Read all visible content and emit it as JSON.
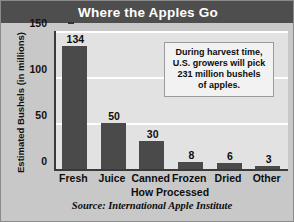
{
  "chart_data": {
    "type": "bar",
    "title": "Where the Apples Go",
    "xlabel": "How Processed",
    "ylabel": "Estimated Bushels (in millions)",
    "categories": [
      "Fresh",
      "Juice",
      "Canned",
      "Frozen",
      "Dried",
      "Other"
    ],
    "values": [
      134,
      50,
      30,
      8,
      6,
      3
    ],
    "value_labels": [
      "134",
      "50",
      "30",
      "8",
      "6",
      "3"
    ],
    "ylim": [
      0,
      150
    ],
    "yticks": [
      0,
      50,
      100,
      150
    ],
    "ytick_labels": [
      "0",
      "50",
      "100",
      "150"
    ],
    "grid": "horizontal",
    "legend": "none",
    "source": "Source: International Apple Institute",
    "annotation": {
      "line1": "During harvest time,",
      "line2": "U.S. growers will pick",
      "line3": "231 million bushels",
      "line4": "of apples."
    },
    "colors": {
      "bar": "#4a4a4a",
      "title_bar": "#4e4e4e",
      "title_text": "#ffffff",
      "figure_background": "#c8c8c8",
      "plot_background": "#e2e2e2",
      "gridline": "#ffffff",
      "axis": "#3a3a3a",
      "callout_background": "#f2f2f2",
      "callout_border": "#9a9a9a"
    }
  }
}
